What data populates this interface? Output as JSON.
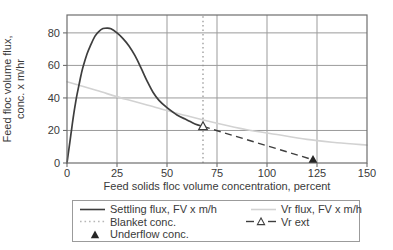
{
  "chart_data": {
    "type": "line",
    "title": "",
    "xlabel": "Feed solids floc volume concentration, percent",
    "ylabel_line1": "Feed floc volume flux,",
    "ylabel_line2": "conc. x m/hr",
    "xlim": [
      0,
      150
    ],
    "ylim": [
      0,
      91
    ],
    "x_ticks": [
      0,
      25,
      50,
      75,
      100,
      125,
      150
    ],
    "y_ticks": [
      0,
      20,
      40,
      60,
      80
    ],
    "grid": true,
    "legend_position": "bottom",
    "series": [
      {
        "name": "Settling flux, FV x m/h",
        "style": "solid-dark",
        "points": [
          [
            0,
            0
          ],
          [
            1,
            9
          ],
          [
            2,
            18
          ],
          [
            3,
            27
          ],
          [
            4,
            35
          ],
          [
            5,
            42
          ],
          [
            6,
            48
          ],
          [
            7,
            54
          ],
          [
            8,
            59
          ],
          [
            10,
            67
          ],
          [
            12,
            73
          ],
          [
            14,
            78
          ],
          [
            16,
            81
          ],
          [
            18,
            82.7
          ],
          [
            20,
            83
          ],
          [
            22,
            82.5
          ],
          [
            25,
            80
          ],
          [
            28,
            76.5
          ],
          [
            31,
            72
          ],
          [
            34,
            66
          ],
          [
            37,
            58.5
          ],
          [
            40,
            50.5
          ],
          [
            43,
            43.5
          ],
          [
            46,
            38.5
          ],
          [
            50,
            34
          ],
          [
            55,
            29.5
          ],
          [
            60,
            26.5
          ],
          [
            64,
            24
          ],
          [
            68,
            22.5
          ]
        ]
      },
      {
        "name": "Vr flux, FV x m/h",
        "style": "solid-light",
        "points": [
          [
            0,
            50
          ],
          [
            15,
            44.5
          ],
          [
            30,
            39
          ],
          [
            45,
            34
          ],
          [
            60,
            29
          ],
          [
            75,
            24.5
          ],
          [
            90,
            20.5
          ],
          [
            105,
            17.5
          ],
          [
            120,
            14.5
          ],
          [
            135,
            12.5
          ],
          [
            150,
            11
          ]
        ]
      },
      {
        "name": "Vr ext",
        "style": "dashed",
        "points": [
          [
            68,
            22.5
          ],
          [
            123,
            2
          ]
        ]
      },
      {
        "name": "Blanket conc.",
        "style": "dotted-vertical",
        "x": 68
      }
    ],
    "markers": [
      {
        "name": "blanket-intersection",
        "shape": "triangle-open",
        "at": [
          68,
          22.5
        ]
      },
      {
        "name": "Underflow conc.",
        "shape": "triangle-filled",
        "at": [
          123,
          2
        ]
      }
    ]
  },
  "legend": {
    "left": [
      {
        "label": "Settling flux, FV x m/h",
        "swatch": "solid-dark-line"
      },
      {
        "label": "Blanket conc.",
        "swatch": "dotted-light-line"
      },
      {
        "label": "Underflow conc.",
        "swatch": "filled-triangle"
      }
    ],
    "right": [
      {
        "label": "Vr flux, FV x m/h",
        "swatch": "solid-light-line"
      },
      {
        "label": "Vr ext",
        "swatch": "dash-open-triangle"
      }
    ]
  },
  "colors": {
    "curve_dark": "#3e3e3e",
    "curve_light": "#d2d2d2",
    "grid": "#9b9b9b",
    "frame": "#6e6e6e",
    "dotted": "#8f8f8f",
    "text": "#3a3a3a",
    "marker_fill": "#262626",
    "background": "#ffffff"
  }
}
